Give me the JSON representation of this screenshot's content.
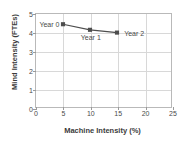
{
  "chart_data": {
    "type": "line",
    "title": "",
    "xlabel": "Machine Intensity (%)",
    "ylabel": "Mind Intensity (FTEs)",
    "xlim": [
      0,
      25
    ],
    "ylim": [
      0,
      5
    ],
    "xticks": [
      "0",
      "5",
      "10",
      "15",
      "20",
      "25"
    ],
    "yticks": [
      "0",
      "1",
      "2",
      "3",
      "4",
      "5"
    ],
    "grid": "both",
    "legend": "none",
    "series": [
      {
        "name": "Mind vs Machine Intensity",
        "color": "#4d4d4d",
        "points": [
          {
            "label": "Year 0",
            "x": 5,
            "y": 4.45,
            "label_pos": "left"
          },
          {
            "label": "Year 1",
            "x": 10,
            "y": 4.15,
            "label_pos": "below"
          },
          {
            "label": "Year 2",
            "x": 15,
            "y": 4.0,
            "label_pos": "right"
          }
        ]
      }
    ]
  },
  "axis": {
    "x_title": "Machine Intensity (%)",
    "y_title": "Mind Intensity (FTEs)"
  },
  "labels": {
    "year0": "Year 0",
    "year1": "Year 1",
    "year2": "Year 2"
  },
  "colors": {
    "series": "#4d4d4d",
    "grid": "#d8d8d8",
    "frame": "#b9b9b9",
    "text": "#3b3b3b"
  }
}
